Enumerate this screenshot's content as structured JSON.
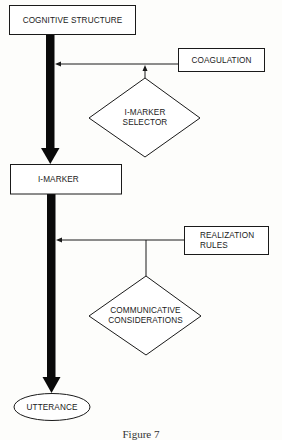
{
  "diagram": {
    "nodes": {
      "cognitive_structure": {
        "label": "COGNITIVE STRUCTURE",
        "shape": "rectangle"
      },
      "coagulation": {
        "label": "COAGULATION",
        "shape": "rectangle"
      },
      "imarker_selector": {
        "line1": "I-MARKER",
        "line2": "SELECTOR",
        "shape": "diamond"
      },
      "imarker": {
        "label": "I-MARKER",
        "shape": "rectangle"
      },
      "realization_rules": {
        "line1": "REALIZATION",
        "line2": "RULES",
        "shape": "rectangle"
      },
      "communicative_considerations": {
        "line1": "COMMUNICATIVE",
        "line2": "CONSIDERATIONS",
        "shape": "diamond"
      },
      "utterance": {
        "label": "UTTERANCE",
        "shape": "ellipse"
      }
    },
    "edges": [
      {
        "from": "COGNITIVE STRUCTURE",
        "to": "I-MARKER",
        "style": "thick-arrow"
      },
      {
        "from": "COAGULATION",
        "to": "COGNITIVE STRUCTURE → I-MARKER path",
        "style": "thin-arrow"
      },
      {
        "from": "I-MARKER SELECTOR",
        "to": "COAGULATION line",
        "style": "thin-arrow"
      },
      {
        "from": "I-MARKER",
        "to": "UTTERANCE",
        "style": "thick-arrow"
      },
      {
        "from": "REALIZATION RULES",
        "to": "I-MARKER → UTTERANCE path",
        "style": "thin-arrow"
      },
      {
        "from": "COMMUNICATIVE CONSIDERATIONS",
        "to": "REALIZATION RULES line",
        "style": "thin-line"
      }
    ],
    "caption": "Figure 7"
  },
  "colors": {
    "ink": "#1a1a1a",
    "paper": "#fdfdfb"
  }
}
